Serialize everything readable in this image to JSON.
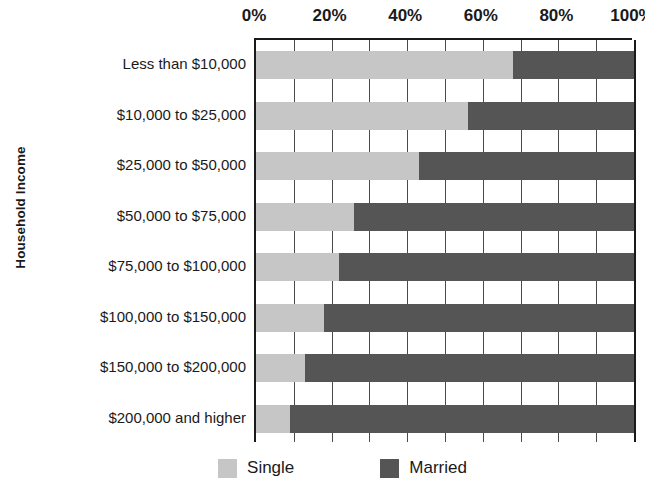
{
  "chart_data": {
    "type": "bar",
    "orientation": "horizontal",
    "stacked": true,
    "normalized": true,
    "title": "",
    "xlabel": "",
    "ylabel": "Household Income",
    "xlim": [
      0,
      100
    ],
    "grid": true,
    "grid_interval": 10,
    "tick_interval": 20,
    "legend_position": "bottom",
    "categories": [
      "Less than $10,000",
      "$10,000 to $25,000",
      "$25,000 to $50,000",
      "$50,000 to $75,000",
      "$75,000 to $100,000",
      "$100,000 to $150,000",
      "$150,000 to $200,000",
      "$200,000 and higher"
    ],
    "x_tick_labels": [
      "0%",
      "20%",
      "40%",
      "60%",
      "80%",
      "100%"
    ],
    "x_tick_values": [
      0,
      20,
      40,
      60,
      80,
      100
    ],
    "series": [
      {
        "name": "Single",
        "color": "#c6c6c6",
        "values": [
          68,
          56,
          43,
          26,
          22,
          18,
          13,
          9
        ]
      },
      {
        "name": "Married",
        "color": "#555555",
        "values": [
          32,
          44,
          57,
          74,
          78,
          82,
          87,
          91
        ]
      }
    ]
  },
  "legend": {
    "items": [
      {
        "label": "Single",
        "color": "#c6c6c6"
      },
      {
        "label": "Married",
        "color": "#555555"
      }
    ]
  },
  "axes": {
    "y_title": "Household Income"
  },
  "colors": {
    "axis": "#1a1a1a",
    "grid": "#4a4a4a",
    "background": "#ffffff",
    "single": "#c6c6c6",
    "married": "#555555"
  }
}
